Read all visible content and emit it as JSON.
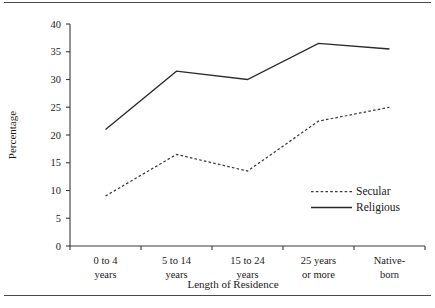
{
  "chart_data": {
    "type": "line",
    "title": "",
    "xlabel": "Length of Residence",
    "ylabel": "Percentage",
    "categories": [
      "0 to 4 years",
      "5 to 14 years",
      "15 to 24 years",
      "25 years or more",
      "Native-born"
    ],
    "category_lines": [
      [
        "0 to 4",
        "years"
      ],
      [
        "5 to 14",
        "years"
      ],
      [
        "15 to 24",
        "years"
      ],
      [
        "25 years",
        "or more"
      ],
      [
        "Native-",
        "born"
      ]
    ],
    "series": [
      {
        "name": "Secular",
        "style": "dashed",
        "color": "#3a3a3a",
        "values": [
          9,
          16.5,
          13.5,
          22.5,
          25
        ]
      },
      {
        "name": "Religious",
        "style": "solid",
        "color": "#2a2a2a",
        "values": [
          21,
          31.5,
          30,
          36.5,
          35.5
        ]
      }
    ],
    "ylim": [
      0,
      40
    ],
    "ytick_values": [
      0,
      5,
      10,
      15,
      20,
      25,
      30,
      35,
      40
    ],
    "ytick_labels": [
      "0",
      "5",
      "10",
      "15",
      "20",
      "25",
      "30",
      "35",
      "40"
    ],
    "grid": false,
    "legend_position": "bottom-right"
  },
  "legend": {
    "entries": [
      {
        "label": "Secular"
      },
      {
        "label": "Religious"
      }
    ]
  },
  "axes": {
    "y_title": "Percentage",
    "x_title": "Length of Residence"
  }
}
